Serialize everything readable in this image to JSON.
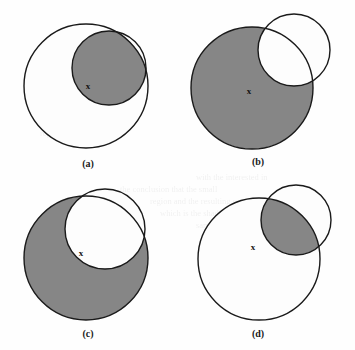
{
  "figure": {
    "background_color": "#fefefe",
    "stroke_color": "#1a1a1a",
    "fill_gray": "#868686",
    "fill_white": "#fdfdfd",
    "stroke_width": 1.4,
    "marker_symbol": "x"
  },
  "panels": [
    {
      "id": "a",
      "caption": "(a)",
      "caption_x": 88,
      "caption_y": 167,
      "operation": "intersection",
      "shaded_region": "intersection",
      "big_circle": {
        "cx": 86,
        "cy": 86,
        "r": 62
      },
      "small_circle": {
        "cx": 109,
        "cy": 68,
        "r": 37
      },
      "marker": {
        "x": 88,
        "y": 87
      }
    },
    {
      "id": "b",
      "caption": "(b)",
      "caption_x": 258,
      "caption_y": 165,
      "operation": "difference",
      "shaded_region": "big-minus-small",
      "big_circle": {
        "cx": 252,
        "cy": 88,
        "r": 61
      },
      "small_circle": {
        "cx": 294,
        "cy": 50,
        "r": 36
      },
      "marker": {
        "x": 249,
        "y": 92
      }
    },
    {
      "id": "c",
      "caption": "(c)",
      "caption_x": 88,
      "caption_y": 337,
      "operation": "difference",
      "shaded_region": "big-minus-small",
      "big_circle": {
        "cx": 86,
        "cy": 258,
        "r": 62
      },
      "small_circle": {
        "cx": 105,
        "cy": 229,
        "r": 40
      },
      "marker": {
        "x": 81,
        "y": 254
      }
    },
    {
      "id": "d",
      "caption": "(d)",
      "caption_x": 258,
      "caption_y": 337,
      "operation": "intersection",
      "shaded_region": "intersection",
      "big_circle": {
        "cx": 259,
        "cy": 259,
        "r": 61
      },
      "small_circle": {
        "cx": 296,
        "cy": 220,
        "r": 35
      },
      "marker": {
        "x": 253,
        "y": 248
      }
    }
  ],
  "scan_bleed_lines": [
    {
      "text": "with the interested in",
      "x": 196,
      "y": 180
    },
    {
      "text": "the conclusion that the small",
      "x": 120,
      "y": 192
    },
    {
      "text": "region and the resulting set",
      "x": 150,
      "y": 204
    },
    {
      "text": "which is the shaded area",
      "x": 160,
      "y": 216
    },
    {
      "text": "same shall find and",
      "x": 196,
      "y": 228
    },
    {
      "text": "for the point x is",
      "x": 200,
      "y": 240
    },
    {
      "text": "and the other",
      "x": 210,
      "y": 252
    },
    {
      "text": "regions shown",
      "x": 40,
      "y": 136
    }
  ]
}
